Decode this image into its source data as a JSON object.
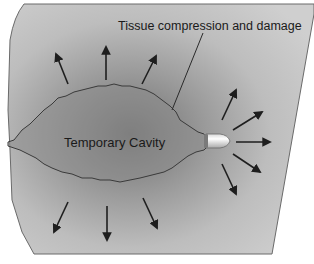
{
  "diagram": {
    "type": "illustration",
    "labels": {
      "tissue_label": "Tissue compression and damage",
      "cavity_label": "Temporary Cavity"
    },
    "colors": {
      "background": "#ffffff",
      "tissue_light": "#c4c4c4",
      "tissue_mid": "#a8a8a8",
      "cavity_fill": "#8c8c8c",
      "outline": "#3a3a3a",
      "arrow": "#1e1e1e",
      "bullet_body": "#e6e6e6",
      "bullet_shade": "#7a7a7a"
    },
    "arrows": {
      "count": 11,
      "description": "Radiating arrows indicating outward pressure from the cavity and bullet",
      "top": 3,
      "bottom": 3,
      "right_fan": 5
    }
  }
}
